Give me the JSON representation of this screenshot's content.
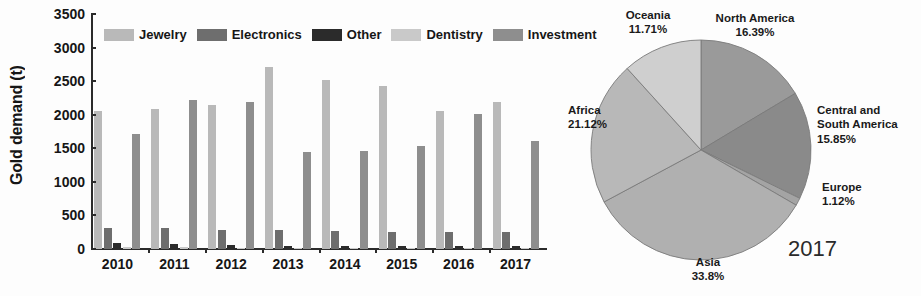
{
  "chart_data": [
    {
      "type": "bar",
      "id": "gold-demand-by-sector",
      "title": "",
      "xlabel": "",
      "ylabel": "Gold demand (t)",
      "ylim": [
        0,
        3500
      ],
      "yticks": [
        0,
        500,
        1000,
        1500,
        2000,
        2500,
        3000,
        3500
      ],
      "grid": false,
      "legend_position": "top-inside",
      "categories": [
        "2010",
        "2011",
        "2012",
        "2013",
        "2014",
        "2015",
        "2016",
        "2017"
      ],
      "series": [
        {
          "name": "Jewelry",
          "color": "#b9b9b9",
          "values": [
            2055,
            2090,
            2140,
            2710,
            2515,
            2430,
            2055,
            2195
          ]
        },
        {
          "name": "Electronics",
          "color": "#6e6e6e",
          "values": [
            320,
            310,
            285,
            280,
            275,
            260,
            250,
            260
          ]
        },
        {
          "name": "Other",
          "color": "#2b2b2b",
          "values": [
            85,
            70,
            55,
            45,
            42,
            40,
            38,
            45
          ]
        },
        {
          "name": "Dentistry",
          "color": "#c9c9c9",
          "values": [
            32,
            24,
            18,
            16,
            14,
            12,
            11,
            10
          ]
        },
        {
          "name": "Investment",
          "color": "#8e8e8e",
          "values": [
            1710,
            2220,
            2185,
            1440,
            1465,
            1540,
            2005,
            1615
          ]
        }
      ]
    },
    {
      "type": "pie",
      "id": "gold-production-by-region-2017",
      "title": "2017",
      "labels": [
        "North America",
        "Central and South America",
        "Europe",
        "Asia",
        "Africa",
        "Oceania"
      ],
      "values": [
        16.39,
        15.85,
        1.12,
        33.8,
        21.12,
        11.71
      ],
      "value_labels": [
        "16.39%",
        "15.85%",
        "1.12%",
        "33.8%",
        "21.12%",
        "11.71%"
      ],
      "colors": [
        "#9a9a9a",
        "#8a8a8a",
        "#a4a4a4",
        "#b0b0b0",
        "#b8b8b8",
        "#cfcfcf"
      ],
      "start_angle_deg": 0,
      "direction": "clockwise"
    }
  ],
  "bar_chart": {
    "ylabel": "Gold demand (t)",
    "ytick_labels": [
      "0",
      "500",
      "1000",
      "1500",
      "2000",
      "2500",
      "3000",
      "3500"
    ],
    "xtick_labels": [
      "2010",
      "2011",
      "2012",
      "2013",
      "2014",
      "2015",
      "2016",
      "2017"
    ],
    "legend": [
      {
        "label": "Jewelry",
        "color": "#b9b9b9"
      },
      {
        "label": "Electronics",
        "color": "#6e6e6e"
      },
      {
        "label": "Other",
        "color": "#2b2b2b"
      },
      {
        "label": "Dentistry",
        "color": "#c9c9c9"
      },
      {
        "label": "Investment",
        "color": "#8e8e8e"
      }
    ]
  },
  "pie_chart": {
    "year_label": "2017",
    "slices": [
      {
        "name": "North America",
        "percent_label": "16.39%",
        "value": 16.39,
        "color": "#9a9a9a"
      },
      {
        "name": "Central and South America",
        "percent_label": "15.85%",
        "value": 15.85,
        "color": "#8a8a8a"
      },
      {
        "name": "Europe",
        "percent_label": "1.12%",
        "value": 1.12,
        "color": "#a4a4a4"
      },
      {
        "name": "Asia",
        "percent_label": "33.8%",
        "value": 33.8,
        "color": "#b0b0b0"
      },
      {
        "name": "Africa",
        "percent_label": "21.12%",
        "value": 21.12,
        "color": "#b8b8b8"
      },
      {
        "name": "Oceania",
        "percent_label": "11.71%",
        "value": 11.71,
        "color": "#cfcfcf"
      }
    ],
    "label_lines": {
      "north_america_l1": "North America",
      "north_america_l2": "16.39%",
      "central_south_america_l1": "Central and",
      "central_south_america_l2": "South America",
      "central_south_america_l3": "15.85%",
      "europe_l1": "Europe",
      "europe_l2": "1.12%",
      "asia_l1": "Asia",
      "asia_l2": "33.8%",
      "africa_l1": "Africa",
      "africa_l2": "21.12%",
      "oceania_l1": "Oceania",
      "oceania_l2": "11.71%"
    }
  }
}
